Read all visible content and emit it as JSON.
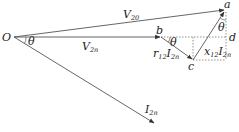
{
  "diagram": {
    "type": "phasor-diagram",
    "colors": {
      "line": "#555555",
      "text": "#222222",
      "dotted": "#777777"
    },
    "points": {
      "O": {
        "label": "O",
        "x": 14,
        "y": 37
      },
      "a": {
        "label": "a",
        "x": 225,
        "y": 10
      },
      "b": {
        "label": "b",
        "x": 161,
        "y": 37
      },
      "c": {
        "label": "c",
        "x": 193,
        "y": 60
      },
      "d": {
        "label": "d",
        "x": 225,
        "y": 37
      },
      "I_tip": {
        "x": 155,
        "y": 124
      }
    },
    "vectors": [
      {
        "name": "V20",
        "from": "O",
        "to": "a",
        "label_main": "V",
        "label_sub": "20"
      },
      {
        "name": "V2n",
        "from": "O",
        "to": "b",
        "label_main": "V",
        "label_sub": "2n"
      },
      {
        "name": "r12I2n",
        "from": "b",
        "to": "c",
        "label_main": "r",
        "label_sub": "12",
        "label_main2": "I",
        "label_sub2": "2n"
      },
      {
        "name": "x12I2n",
        "from": "c",
        "to": "a",
        "label_main": "x",
        "label_sub": "12",
        "label_main2": "I",
        "label_sub2": "2n"
      },
      {
        "name": "I2n",
        "from": "O",
        "to": "I_tip",
        "label_main": "I",
        "label_sub": "2n"
      }
    ],
    "angles": [
      {
        "at": "O",
        "label": "θ"
      },
      {
        "at": "b",
        "label": "θ"
      },
      {
        "at": "a",
        "label": "θ"
      }
    ]
  }
}
